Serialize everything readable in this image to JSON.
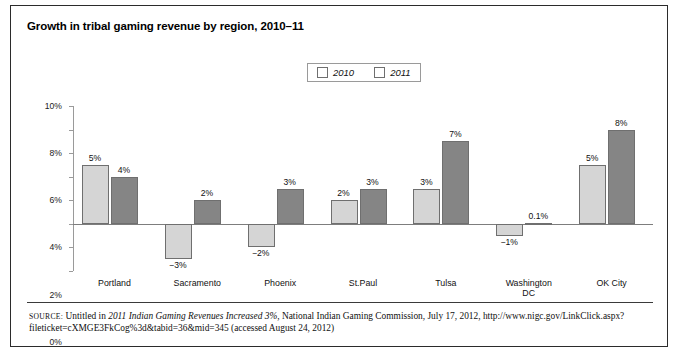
{
  "title": "Growth in tribal gaming revenue by region, 2010–11",
  "legend": {
    "items": [
      {
        "label": "2010",
        "color": "#d5d5d5"
      },
      {
        "label": "2011",
        "color": "#858585"
      }
    ]
  },
  "axis": {
    "y_ticks": [
      "10%",
      "8%",
      "6%",
      "4%",
      "2%",
      "0%",
      "−2%",
      "−4%"
    ]
  },
  "source": {
    "prefix": "SOURCE:",
    "text_before_italic": " Untitled in ",
    "italic_title": "2011 Indian Gaming Revenues Increased 3%",
    "text_after_italic": ", National Indian Gaming Commission, July 17, 2012, http://www.nigc.gov/LinkClick.aspx?fileticket=cXMGE3FkCog%3d&tabid=36&mid=345 (accessed August 24, 2012)"
  },
  "chart_data": {
    "type": "bar",
    "title": "Growth in tribal gaming revenue by region, 2010–11",
    "xlabel": "",
    "ylabel": "",
    "ylim": [
      -4,
      10
    ],
    "ytick_values": [
      10,
      8,
      6,
      4,
      2,
      0,
      -2,
      -4
    ],
    "grid": false,
    "legend_position": "top-center",
    "categories": [
      "Portland",
      "Sacramento",
      "Phoenix",
      "St.Paul",
      "Tulsa",
      "Washington DC",
      "OK City"
    ],
    "category_labels": [
      [
        "Portland"
      ],
      [
        "Sacramento"
      ],
      [
        "Phoenix"
      ],
      [
        "St.Paul"
      ],
      [
        "Tulsa"
      ],
      [
        "Washington",
        "DC"
      ],
      [
        "OK City"
      ]
    ],
    "series": [
      {
        "name": "2010",
        "color": "#d5d5d5",
        "values": [
          5,
          -3,
          -2,
          2,
          3,
          -1,
          5
        ],
        "data_labels": [
          "5%",
          "−3%",
          "−2%",
          "2%",
          "3%",
          "−1%",
          "5%"
        ]
      },
      {
        "name": "2011",
        "color": "#858585",
        "values": [
          4,
          2,
          3,
          3,
          7,
          0.1,
          8
        ],
        "data_labels": [
          "4%",
          "2%",
          "3%",
          "3%",
          "7%",
          "0.1%",
          "8%"
        ]
      }
    ]
  }
}
